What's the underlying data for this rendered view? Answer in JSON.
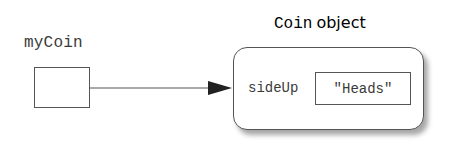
{
  "diagram": {
    "variable": {
      "name": "myCoin"
    },
    "object": {
      "title_class": "Coin",
      "title_suffix": "object",
      "field": {
        "name": "sideUp",
        "value": "\"Heads\""
      }
    },
    "edges": [
      {
        "from": "myCoin",
        "to": "Coin object",
        "type": "reference-arrow"
      }
    ],
    "colors": {
      "stroke": "#555555",
      "text": "#3a3a3a",
      "background": "#ffffff"
    }
  }
}
